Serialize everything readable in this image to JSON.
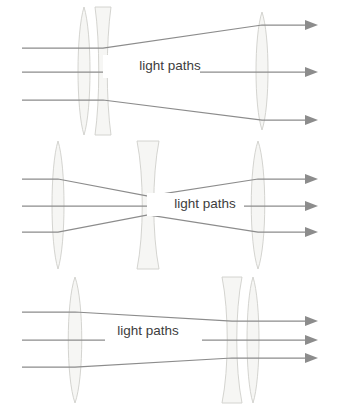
{
  "figure": {
    "background_color": "#ffffff",
    "width": 339,
    "height": 411,
    "ray_color": "#8c8c8c",
    "lens_fill_color": "#f6f6f4",
    "lens_stroke_color": "#cfcfcb",
    "label_text_color": "#3d3d3d"
  },
  "diagrams": [
    {
      "id": "diagram-1",
      "name": "beam-expander-diverging-output",
      "label": "light paths",
      "label_x": 170,
      "label_y": 66,
      "label_box_x": 103,
      "label_box_y": 55,
      "label_box_w": 97,
      "label_box_h": 23,
      "lenses": [
        {
          "name": "convex-lens-1",
          "type": "convex",
          "cx": 84,
          "cy": 71,
          "half_height": 64,
          "half_width": 8
        },
        {
          "name": "concave-lens-1",
          "type": "concave",
          "cx": 103,
          "cy": 71,
          "half_height": 64,
          "half_width": 8,
          "waist": 3
        },
        {
          "name": "convex-lens-2",
          "type": "convex",
          "cx": 262,
          "cy": 71,
          "half_height": 59,
          "half_width": 8
        }
      ],
      "rays": [
        {
          "name": "ray-top",
          "points": "22,48 84,48 103,48 262,25 305,25"
        },
        {
          "name": "ray-middle",
          "points": "22,72 84,72 103,72 262,72 305,72"
        },
        {
          "name": "ray-bottom",
          "points": "22,100 84,100 103,100 262,120 305,120"
        }
      ],
      "arrows": [
        {
          "name": "arrow-top",
          "x": 305,
          "y": 25
        },
        {
          "name": "arrow-middle",
          "x": 305,
          "y": 72
        },
        {
          "name": "arrow-bottom",
          "x": 305,
          "y": 120
        }
      ]
    },
    {
      "id": "diagram-2",
      "name": "galilean-relay-parallel-output",
      "label": "light paths",
      "label_x": 205,
      "label_y": 204,
      "label_box_x": 147,
      "label_box_y": 193,
      "label_box_w": 97,
      "label_box_h": 23,
      "lenses": [
        {
          "name": "convex-lens-1",
          "type": "convex",
          "cx": 58,
          "cy": 205,
          "half_height": 64,
          "half_width": 8
        },
        {
          "name": "concave-lens-1",
          "type": "concave",
          "cx": 148,
          "cy": 205,
          "half_height": 64,
          "half_width": 11,
          "waist": 4
        },
        {
          "name": "convex-lens-2",
          "type": "convex",
          "cx": 258,
          "cy": 205,
          "half_height": 64,
          "half_width": 9
        }
      ],
      "rays": [
        {
          "name": "ray-top",
          "points": "22,179 58,179 148,196 258,179 305,179"
        },
        {
          "name": "ray-middle",
          "points": "22,206 58,206 148,206 258,206 305,206"
        },
        {
          "name": "ray-bottom",
          "points": "22,232 58,232 148,215 258,232 305,232"
        }
      ],
      "arrows": [
        {
          "name": "arrow-top",
          "x": 305,
          "y": 179
        },
        {
          "name": "arrow-middle",
          "x": 305,
          "y": 206
        },
        {
          "name": "arrow-bottom",
          "x": 305,
          "y": 232
        }
      ]
    },
    {
      "id": "diagram-3",
      "name": "beam-condenser-converging-output",
      "label": "light paths",
      "label_x": 148,
      "label_y": 331,
      "label_box_x": 105,
      "label_box_y": 320,
      "label_box_w": 97,
      "label_box_h": 23,
      "lenses": [
        {
          "name": "convex-lens-1",
          "type": "convex",
          "cx": 75,
          "cy": 340,
          "half_height": 63,
          "half_width": 9
        },
        {
          "name": "concave-lens-1",
          "type": "concave",
          "cx": 232,
          "cy": 340,
          "half_height": 63,
          "half_width": 10,
          "waist": 3
        },
        {
          "name": "convex-lens-2",
          "type": "convex",
          "cx": 253,
          "cy": 340,
          "half_height": 63,
          "half_width": 8
        }
      ],
      "rays": [
        {
          "name": "ray-top",
          "points": "22,312 75,312 232,321 253,321 305,321"
        },
        {
          "name": "ray-middle",
          "points": "22,340 75,340 232,340 253,340 305,340"
        },
        {
          "name": "ray-bottom",
          "points": "22,367 75,367 232,358 253,358 305,358"
        }
      ],
      "arrows": [
        {
          "name": "arrow-top",
          "x": 305,
          "y": 321
        },
        {
          "name": "arrow-middle",
          "x": 305,
          "y": 340
        },
        {
          "name": "arrow-bottom",
          "x": 305,
          "y": 358
        }
      ]
    }
  ]
}
